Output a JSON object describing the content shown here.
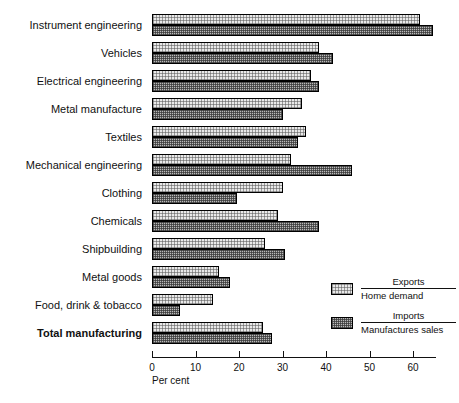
{
  "chart_data": {
    "type": "bar",
    "orientation": "horizontal",
    "title": "",
    "xlabel": "Per cent",
    "ylabel": "",
    "xlim": [
      0,
      69
    ],
    "grid": false,
    "tick_labels": [
      "0",
      "10",
      "20",
      "30",
      "40",
      "50",
      "60"
    ],
    "tick_values": [
      0,
      10,
      20,
      30,
      40,
      50,
      60
    ],
    "legend_position": "inside-bottom-right",
    "categories": [
      "Instrument engineering",
      "Vehicles",
      "Electrical engineering",
      "Metal manufacture",
      "Textiles",
      "Mechanical engineering",
      "Clothing",
      "Chemicals",
      "Shipbuilding",
      "Metal goods",
      "Food, drink & tobacco",
      "Total manufacturing"
    ],
    "emphasised_categories": [
      "Total manufacturing"
    ],
    "series": [
      {
        "name": "Exports / Home demand",
        "numerator": "Exports",
        "denominator": "Home demand",
        "style": "light",
        "values": [
          61.5,
          38.5,
          36.5,
          34.5,
          35.5,
          32.0,
          30.0,
          29.0,
          26.0,
          15.5,
          14.0,
          25.5
        ]
      },
      {
        "name": "Imports / Manufactures sales",
        "numerator": "Imports",
        "denominator": "Manufactures sales",
        "style": "dark",
        "values": [
          64.5,
          41.5,
          38.5,
          30.0,
          33.5,
          46.0,
          19.5,
          38.5,
          30.5,
          18.0,
          6.5,
          27.5
        ]
      }
    ],
    "colors": {
      "light_fill": "#e9e9e9",
      "dark_fill": "#b9b9b9",
      "outline": "#000000",
      "background": "#ffffff",
      "text": "#111111"
    }
  }
}
